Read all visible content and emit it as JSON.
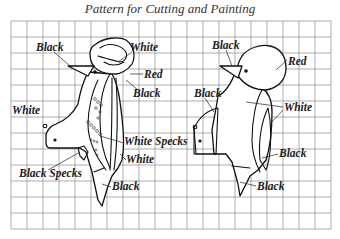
{
  "title": "Pattern for Cutting and Painting",
  "grid": {
    "left": 11,
    "top": 21,
    "cell": 16,
    "cols": 20,
    "rows": 13,
    "line_color": "#8a8a8a"
  },
  "left_pattern": {
    "labels": [
      {
        "text": "Black",
        "x": 36,
        "y": 51
      },
      {
        "text": "White",
        "x": 130,
        "y": 51
      },
      {
        "text": "Red",
        "x": 144,
        "y": 78
      },
      {
        "text": "Black",
        "x": 133,
        "y": 97
      },
      {
        "text": "White",
        "x": 12,
        "y": 114
      },
      {
        "text": "White Specks",
        "x": 124,
        "y": 145
      },
      {
        "text": "White",
        "x": 126,
        "y": 163
      },
      {
        "text": "Black Specks",
        "x": 19,
        "y": 177
      },
      {
        "text": "Black",
        "x": 112,
        "y": 190
      }
    ]
  },
  "right_pattern": {
    "labels": [
      {
        "text": "Black",
        "x": 212,
        "y": 49
      },
      {
        "text": "Red",
        "x": 288,
        "y": 65
      },
      {
        "text": "Black",
        "x": 194,
        "y": 97
      },
      {
        "text": "White",
        "x": 284,
        "y": 111
      },
      {
        "text": "Black",
        "x": 279,
        "y": 157
      },
      {
        "text": "Black",
        "x": 257,
        "y": 190
      }
    ]
  }
}
